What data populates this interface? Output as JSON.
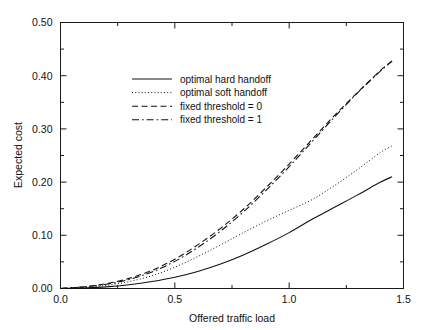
{
  "chart_data": {
    "type": "line",
    "title": "",
    "subtitle": "",
    "xlabel": "Offered traffic load",
    "ylabel": "Expected cost",
    "xlim": [
      0.0,
      1.5
    ],
    "ylim": [
      0.0,
      0.5
    ],
    "grid": false,
    "legend_position": "upper center-left",
    "x_ticks": [
      "0.0",
      "0.5",
      "1.0",
      "1.5"
    ],
    "x_tick_values": [
      0.0,
      0.5,
      1.0,
      1.5
    ],
    "x_minor_tick_values": [
      0.25,
      0.75,
      1.25
    ],
    "y_ticks": [
      "0.00",
      "0.10",
      "0.20",
      "0.30",
      "0.40",
      "0.50"
    ],
    "y_tick_values": [
      0.0,
      0.1,
      0.2,
      0.3,
      0.4,
      0.5
    ],
    "y_minor_tick_values": [
      0.05,
      0.15,
      0.25,
      0.35,
      0.45
    ],
    "x": [
      0.0,
      0.1,
      0.2,
      0.3,
      0.4,
      0.5,
      0.6,
      0.7,
      0.8,
      0.9,
      1.0,
      1.1,
      1.2,
      1.3,
      1.4,
      1.45
    ],
    "series": [
      {
        "name": "optimal hard handoff",
        "style": "solid",
        "color": "#111111",
        "values": [
          0.0,
          0.001,
          0.003,
          0.007,
          0.013,
          0.021,
          0.032,
          0.046,
          0.063,
          0.083,
          0.105,
          0.13,
          0.153,
          0.176,
          0.2,
          0.21
        ]
      },
      {
        "name": "optimal soft handoff",
        "style": "dotted",
        "color": "#111111",
        "values": [
          0.0,
          0.002,
          0.006,
          0.013,
          0.024,
          0.04,
          0.06,
          0.082,
          0.105,
          0.127,
          0.147,
          0.167,
          0.194,
          0.224,
          0.256,
          0.268
        ]
      },
      {
        "name": "fixed threshold = 0",
        "style": "dashed",
        "color": "#111111",
        "values": [
          0.0,
          0.003,
          0.009,
          0.019,
          0.034,
          0.055,
          0.082,
          0.113,
          0.149,
          0.19,
          0.234,
          0.28,
          0.326,
          0.369,
          0.41,
          0.428
        ]
      },
      {
        "name": "fixed threshold = 1",
        "style": "dashdot",
        "color": "#111111",
        "values": [
          0.0,
          0.003,
          0.008,
          0.017,
          0.031,
          0.051,
          0.077,
          0.108,
          0.144,
          0.185,
          0.229,
          0.276,
          0.323,
          0.368,
          0.409,
          0.427
        ]
      }
    ]
  },
  "legend": {
    "entries": [
      {
        "label": "optimal hard handoff",
        "style": "solid"
      },
      {
        "label": "optimal soft handoff",
        "style": "dotted"
      },
      {
        "label": "fixed threshold = 0",
        "style": "dashed"
      },
      {
        "label": "fixed threshold = 1",
        "style": "dashdot"
      }
    ]
  }
}
